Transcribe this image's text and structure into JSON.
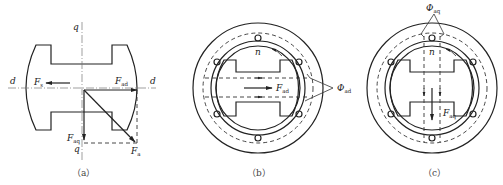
{
  "figure": {
    "panels": [
      {
        "id": "a",
        "caption": "（a）",
        "axes": {
          "d_left": "d",
          "d_right": "d",
          "q_top": "q",
          "q_bottom": "q"
        },
        "vectors": {
          "Fs": {
            "main": "F",
            "sub": "s"
          },
          "Fad": {
            "main": "F",
            "sub": "ad"
          },
          "Faq": {
            "main": "F",
            "sub": "aq"
          },
          "Fa": {
            "main": "F",
            "sub": "a"
          }
        }
      },
      {
        "id": "b",
        "caption": "（b）",
        "rotation_label": "n",
        "vector": {
          "main": "F",
          "sub": "ad"
        },
        "flux": {
          "main": "Φ",
          "sub": "ad"
        }
      },
      {
        "id": "c",
        "caption": "（c）",
        "rotation_label": "n",
        "vector": {
          "main": "F",
          "sub": "aq"
        },
        "flux": {
          "main": "Φ",
          "sub": "aq"
        }
      }
    ]
  }
}
